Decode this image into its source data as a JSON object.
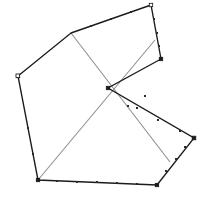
{
  "figure": {
    "width": 208,
    "height": 201,
    "background_color": "#ffffff",
    "outline_color": "#1b1b1b",
    "chord_color": "#8c8c8c",
    "vertex_marker_color": "#1b1b1b"
  },
  "chart_data": {
    "type": "scatter",
    "title": "",
    "subtitle": "",
    "xlabel": "",
    "ylabel": "",
    "grid": false,
    "legend": "none",
    "xlim": [
      0,
      208
    ],
    "ylim": [
      0,
      201
    ],
    "series": [
      {
        "name": "polygon-outline",
        "type": "closed-path",
        "color": "#1b1b1b",
        "points": [
          [
            71,
            33
          ],
          [
            151,
            5
          ],
          [
            161,
            59
          ],
          [
            108,
            88
          ],
          [
            194,
            138
          ],
          [
            157,
            185
          ],
          [
            38,
            180
          ],
          [
            18,
            76
          ]
        ],
        "vertex_labels": [
          "top-left-vertex",
          "top-right-vertex",
          "right-upper-vertex",
          "center-reflex-vertex",
          "right-lower-vertex",
          "bottom-right-vertex",
          "bottom-left-vertex",
          "left-vertex"
        ]
      },
      {
        "name": "chord-a",
        "type": "segment",
        "color": "#8c8c8c",
        "points": [
          [
            71,
            33
          ],
          [
            170,
            162
          ]
        ]
      },
      {
        "name": "chord-b",
        "type": "segment",
        "color": "#8c8c8c",
        "points": [
          [
            155,
            40
          ],
          [
            38,
            180
          ]
        ]
      }
    ],
    "annotations": [
      {
        "name": "chord-intersection",
        "point": [
          104,
          93
        ],
        "label": ""
      }
    ],
    "edge_tick_points": [
      [
        91,
        26
      ],
      [
        111,
        19
      ],
      [
        131,
        12
      ],
      [
        154,
        19
      ],
      [
        157,
        33
      ],
      [
        159,
        46
      ],
      [
        145,
        96
      ],
      [
        128,
        106
      ],
      [
        137,
        108
      ],
      [
        158,
        120
      ],
      [
        180,
        131
      ],
      [
        185,
        147
      ],
      [
        176,
        159
      ],
      [
        166,
        171
      ],
      [
        137,
        184
      ],
      [
        117,
        183
      ],
      [
        97,
        182
      ],
      [
        77,
        182
      ],
      [
        57,
        181
      ],
      [
        33,
        154
      ],
      [
        28,
        128
      ],
      [
        23,
        102
      ]
    ]
  }
}
